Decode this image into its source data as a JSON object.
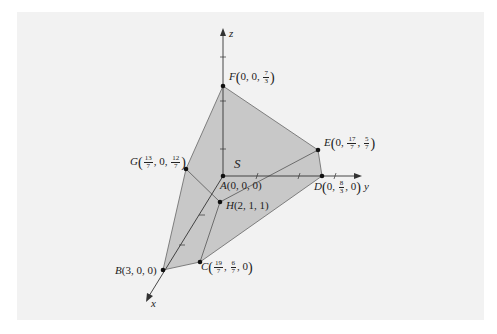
{
  "figure": {
    "region_label": "S",
    "axes": {
      "x": "x",
      "y": "y",
      "z": "z"
    },
    "points": {
      "A": {
        "name": "A",
        "coords": "(0, 0, 0)"
      },
      "B": {
        "name": "B",
        "coords": "(3, 0, 0)"
      },
      "C": {
        "name": "C",
        "c1_num": "19",
        "c1_den": "7",
        "c2_num": "6",
        "c2_den": "7",
        "c3": "0"
      },
      "D": {
        "name": "D",
        "c1": "0",
        "c2_num": "8",
        "c2_den": "3",
        "c3": "0"
      },
      "E": {
        "name": "E",
        "c1": "0",
        "c2_num": "17",
        "c2_den": "7",
        "c3_num": "5",
        "c3_den": "7"
      },
      "F": {
        "name": "F",
        "c1": "0",
        "c2": "0",
        "c3_num": "7",
        "c3_den": "3"
      },
      "G": {
        "name": "G",
        "c1_num": "13",
        "c1_den": "7",
        "c2": "0",
        "c3_num": "12",
        "c3_den": "7"
      },
      "H": {
        "name": "H",
        "coords": "(2, 1, 1)"
      }
    },
    "colors": {
      "fill": "#c8c8c8",
      "edge": "#555555",
      "axis": "#333333",
      "panel": "#f2f2f2"
    }
  }
}
